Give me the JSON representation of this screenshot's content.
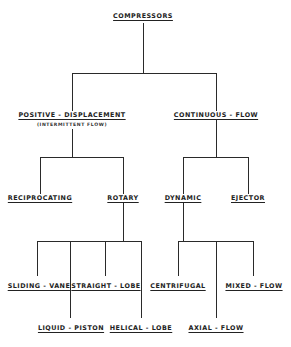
{
  "diagram": {
    "title": "COMPRESSORS",
    "nodes": {
      "root": {
        "label": "COMPRESSORS"
      },
      "positive_displacement": {
        "label": "POSITIVE - DISPLACEMENT",
        "sublabel": "(INTERMITTENT FLOW)"
      },
      "continuous_flow": {
        "label": "CONTINUOUS - FLOW"
      },
      "reciprocating": {
        "label": "RECIPROCATING"
      },
      "rotary": {
        "label": "ROTARY"
      },
      "dynamic": {
        "label": "DYNAMIC"
      },
      "ejector": {
        "label": "EJECTOR"
      },
      "sliding_vane": {
        "label": "SLIDING - VANE"
      },
      "liquid_piston": {
        "label": "LIQUID - PISTON"
      },
      "straight_lobe": {
        "label": "STRAIGHT - LOBE"
      },
      "helical_lobe": {
        "label": "HELICAL - LOBE"
      },
      "centrifugal": {
        "label": "CENTRIFUGAL"
      },
      "axial_flow": {
        "label": "AXIAL - FLOW"
      },
      "mixed_flow": {
        "label": "MIXED - FLOW"
      }
    },
    "edges": [
      [
        "COMPRESSORS",
        "POSITIVE - DISPLACEMENT"
      ],
      [
        "COMPRESSORS",
        "CONTINUOUS - FLOW"
      ],
      [
        "POSITIVE - DISPLACEMENT",
        "RECIPROCATING"
      ],
      [
        "POSITIVE - DISPLACEMENT",
        "ROTARY"
      ],
      [
        "CONTINUOUS - FLOW",
        "DYNAMIC"
      ],
      [
        "CONTINUOUS - FLOW",
        "EJECTOR"
      ],
      [
        "ROTARY",
        "SLIDING - VANE"
      ],
      [
        "ROTARY",
        "LIQUID - PISTON"
      ],
      [
        "ROTARY",
        "STRAIGHT - LOBE"
      ],
      [
        "ROTARY",
        "HELICAL - LOBE"
      ],
      [
        "DYNAMIC",
        "CENTRIFUGAL"
      ],
      [
        "DYNAMIC",
        "AXIAL - FLOW"
      ],
      [
        "DYNAMIC",
        "MIXED - FLOW"
      ]
    ]
  }
}
